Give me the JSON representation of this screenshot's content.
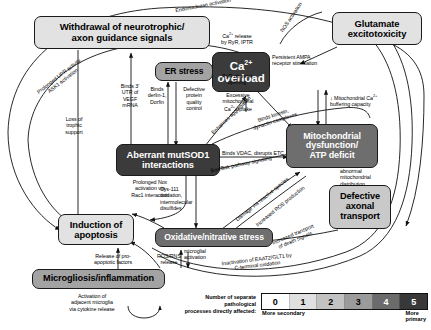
{
  "diagram": {
    "title_present": false,
    "nodes": [
      {
        "id": "withdrawal",
        "label": "Withdrawal of neurotrophic/\naxon guidance signals",
        "shade": 1,
        "font": 9.6
      },
      {
        "id": "er_stress",
        "label": "ER stress",
        "shade": 3,
        "font": 8.6
      },
      {
        "id": "ca_overload",
        "label": "Ca2+\noverload",
        "shade": 5,
        "font": 11.5
      },
      {
        "id": "glutamate",
        "label": "Glutamate\nexcitotoxicity",
        "shade": 1,
        "font": 9.4
      },
      {
        "id": "mutsod1",
        "label": "Aberrant mutSOD1\ninteractions",
        "shade": 5,
        "font": 9.4
      },
      {
        "id": "mito",
        "label": "Mitochondrial\ndysfunction/\nATP deficit",
        "shade": 4,
        "font": 9.0
      },
      {
        "id": "apoptosis",
        "label": "Induction of\napoptosis",
        "shade": 1,
        "font": 9.4
      },
      {
        "id": "oxidative",
        "label": "Oxidative/nitrative stress",
        "shade": 4,
        "font": 8.6
      },
      {
        "id": "axonal",
        "label": "Defective\naxonal\ntransport",
        "shade": 2,
        "font": 9.2
      },
      {
        "id": "microgliosis",
        "label": "Microgliosis/inflammation",
        "shade": 3,
        "font": 9.2
      }
    ],
    "edge_labels": [
      {
        "id": "endonuclease",
        "text": "Endonuclease activation"
      },
      {
        "id": "nos",
        "text": "NOS activation"
      },
      {
        "id": "upr_ask1",
        "text": "Prolonged UPR activity,\nASK1 activation"
      },
      {
        "id": "vegf",
        "text": "Binds 3'\nUTR of\nVEGF\nmRNA"
      },
      {
        "id": "derlin",
        "text": "Binds\nderlin-1,\nDorfin"
      },
      {
        "id": "protein_quality",
        "text": "Defective\nprotein\nquality\ncontrol"
      },
      {
        "id": "ca_release",
        "text": "Ca2+ release\nby RyR, IPTR"
      },
      {
        "id": "ryr_channel",
        "text": "RyR channel\nopening"
      },
      {
        "id": "ampa",
        "text": "Persistent AMPA\nreceptor stimulation"
      },
      {
        "id": "excessive_uptake",
        "text": "Excessive\nmitochondrial\nCa2+ uptake"
      },
      {
        "id": "buffering",
        "text": "↓ Mitochondrial Ca2+\nbuffering capacity"
      },
      {
        "id": "enhances_agg",
        "text": "Enhances aggregation"
      },
      {
        "id": "kinesin",
        "text": "Binds kinesin,\ndynactin complexes"
      },
      {
        "id": "vdac",
        "text": "Binds VDAC, disrupts ETC"
      },
      {
        "id": "loss_trophic",
        "text": "Loss of\ntrophic\nsupport"
      },
      {
        "id": "nox_rac1",
        "text": "Prolonged Nox\nactivation via\nRac1 interaction"
      },
      {
        "id": "cys111",
        "text": "Cys-111\noxidation,\nintermolecular\ndisulfides"
      },
      {
        "id": "baxbak",
        "text": "Bax/Bak pathway signaling"
      },
      {
        "id": "damage_reactive",
        "text": "Damage via reactive species"
      },
      {
        "id": "increased_ros",
        "text": "Increased ROS production"
      },
      {
        "id": "abnormal_distrib",
        "text": "abnormal\nmitochondrial\ndistribution"
      },
      {
        "id": "death_signals",
        "text": "Increased transport\nof death signals"
      },
      {
        "id": "eaat2",
        "text": "Inactivation of EAAT2/GLT1 by\nC-terminal oxidation"
      },
      {
        "id": "pro_apoptotic",
        "text": "Release of pro-\napoptotic factors"
      },
      {
        "id": "ros_rns",
        "text": "ROS/RNS\nrelease"
      },
      {
        "id": "microglial_act",
        "text": "microglial\nactivation"
      },
      {
        "id": "cytokine",
        "text": "Activation of\nadjacent microglia\nvia cytokine release"
      }
    ]
  },
  "legend": {
    "caption": "Number of separate pathological\nprocesses directly affected:",
    "values": [
      "0",
      "1",
      "2",
      "3",
      "4",
      "5"
    ],
    "left_label": "More secondary",
    "right_label": "More primary",
    "colors": [
      "#ffffff",
      "#e0e0e0",
      "#c2c2c2",
      "#9b9b9b",
      "#6b6b6b",
      "#383838"
    ]
  }
}
